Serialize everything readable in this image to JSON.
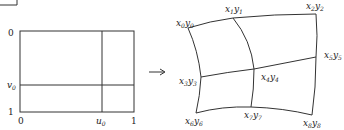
{
  "diagram": {
    "type": "mapping",
    "left_panel": {
      "labels": {
        "v_top": "0",
        "v_mid": "v",
        "v_mid_sub": "0",
        "v_bottom": "1",
        "u_left": "0",
        "u_mid": "u",
        "u_mid_sub": "0",
        "u_right": "1"
      }
    },
    "arrow": {
      "glyph": "→"
    },
    "right_panel": {
      "points": [
        {
          "id": "p0",
          "x": "x",
          "xs": "0",
          "y": "y",
          "ys": "0"
        },
        {
          "id": "p1",
          "x": "x",
          "xs": "1",
          "y": "y",
          "ys": "1"
        },
        {
          "id": "p2",
          "x": "x",
          "xs": "2",
          "y": "y",
          "ys": "2"
        },
        {
          "id": "p3",
          "x": "x",
          "xs": "3",
          "y": "y",
          "ys": "3"
        },
        {
          "id": "p4",
          "x": "x",
          "xs": "4",
          "y": "y",
          "ys": "4"
        },
        {
          "id": "p5",
          "x": "x",
          "xs": "5",
          "y": "y",
          "ys": "5"
        },
        {
          "id": "p6",
          "x": "x",
          "xs": "6",
          "y": "y",
          "ys": "6"
        },
        {
          "id": "p7",
          "x": "x",
          "xs": "7",
          "y": "y",
          "ys": "7"
        },
        {
          "id": "p8",
          "x": "x",
          "xs": "8",
          "y": "y",
          "ys": "8"
        }
      ]
    }
  }
}
